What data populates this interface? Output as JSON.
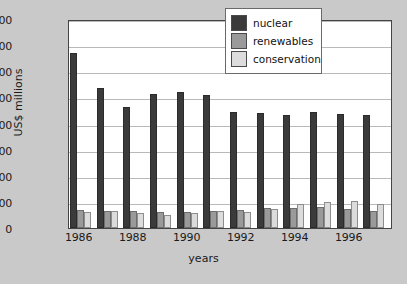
{
  "chart_data": {
    "type": "bar",
    "title": "",
    "xlabel": "years",
    "ylabel": "US$ millions",
    "ylim": [
      0,
      8000
    ],
    "yticks": [
      0,
      1000,
      2000,
      3000,
      4000,
      5000,
      6000,
      7000,
      8000
    ],
    "ytick_labels": [
      "0",
      "1000",
      "2000",
      "3000",
      "4000",
      "5000",
      "6000",
      "7000",
      "8000"
    ],
    "grid": true,
    "legend_position": "top-right",
    "categories": [
      1986,
      1987,
      1988,
      1989,
      1990,
      1991,
      1992,
      1993,
      1994,
      1995,
      1996,
      1997
    ],
    "xtick_labels": [
      "1986",
      "1988",
      "1990",
      "1992",
      "1994",
      "1996"
    ],
    "xtick_categories": [
      1986,
      1988,
      1990,
      1992,
      1994,
      1996
    ],
    "series": [
      {
        "name": "nuclear",
        "color": "#3a3a3a",
        "values": [
          6700,
          5350,
          4650,
          5120,
          5220,
          5100,
          4450,
          4400,
          4320,
          4430,
          4370,
          4320
        ]
      },
      {
        "name": "renewables",
        "color": "#9a9a9a",
        "values": [
          700,
          660,
          650,
          610,
          610,
          660,
          690,
          750,
          760,
          800,
          710,
          670
        ]
      },
      {
        "name": "conservation",
        "color": "#dcdcdc",
        "values": [
          620,
          660,
          580,
          510,
          570,
          660,
          630,
          710,
          930,
          980,
          1040,
          930
        ]
      }
    ]
  },
  "legend": {
    "items": [
      {
        "label": "nuclear",
        "swatch": "sw-nuclear"
      },
      {
        "label": "renewables",
        "swatch": "sw-renewables"
      },
      {
        "label": "conservation",
        "swatch": "sw-conservation"
      }
    ]
  },
  "colors": {
    "background": "#c9c9c9",
    "plot_background": "#ffffff",
    "grid": "#b9b9b9",
    "axis": "#444444",
    "nuclear": "#3a3a3a",
    "renewables": "#9a9a9a",
    "conservation": "#dcdcdc"
  }
}
